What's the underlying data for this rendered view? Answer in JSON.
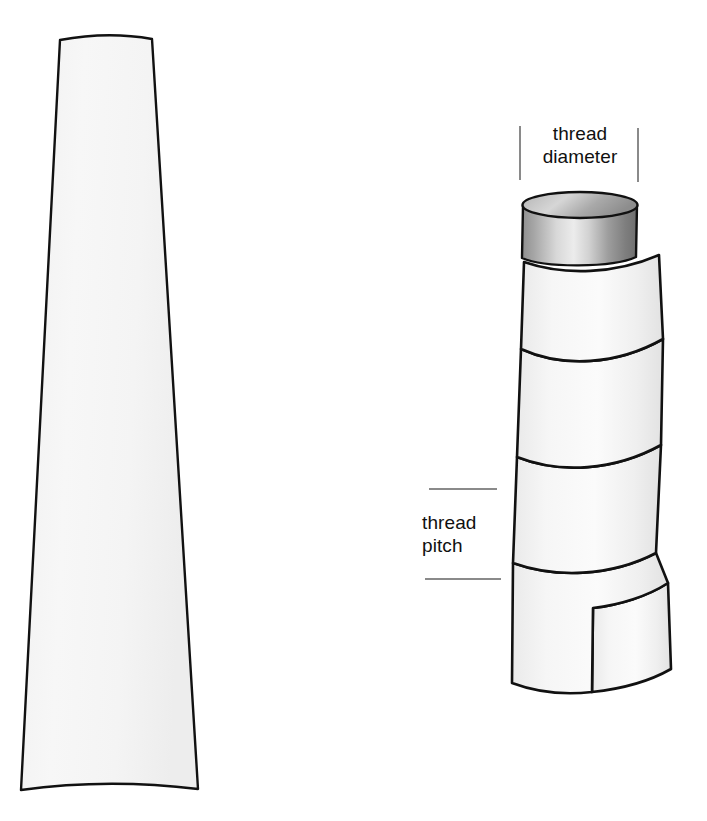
{
  "figure": {
    "background_color": "#ffffff",
    "outline_color": "#111111",
    "fill_color": "#f4f4f4",
    "annotation_line_color": "#8a8a8a",
    "text_color": "#101010"
  },
  "annotations": {
    "thread_diameter": {
      "line1": "thread",
      "line2": "diameter",
      "full_text": "thread diameter"
    },
    "thread_pitch": {
      "line1": "thread",
      "line2": "pitch",
      "full_text": "thread pitch"
    }
  },
  "shapes": {
    "tapered_blade": {
      "name": "tapered trapezoid profile",
      "top_left_x": 60,
      "top_right_x": 152,
      "top_y": 38,
      "bottom_left_x": 20,
      "bottom_right_x": 198,
      "bottom_y": 790
    },
    "screw": {
      "name": "helical threaded cylinder",
      "shank_left_x": 522,
      "shank_right_x": 637,
      "shank_top_y": 196,
      "thread_left_x": 512,
      "thread_right_x": 672,
      "thread_bottom_y": 672,
      "turns": 5
    }
  },
  "dimension_marks": {
    "diameter_tick_left_x": 520,
    "diameter_tick_right_x": 638,
    "diameter_tick_top_y": 126,
    "diameter_tick_bottom_y": 180,
    "pitch_line_upper_y": 489,
    "pitch_line_lower_y": 579,
    "pitch_line_left_x": 427,
    "pitch_line_right_x": 500
  }
}
